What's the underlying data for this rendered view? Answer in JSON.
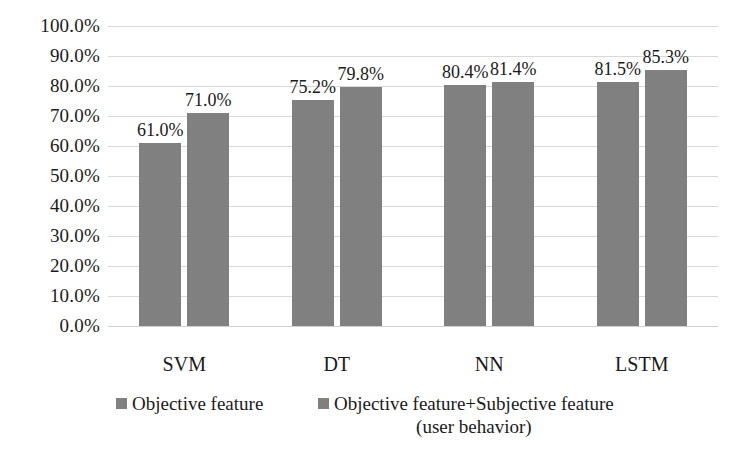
{
  "chart_data": {
    "type": "bar",
    "title": "",
    "xlabel": "",
    "ylabel": "",
    "categories": [
      "SVM",
      "DT",
      "NN",
      "LSTM"
    ],
    "series": [
      {
        "name": "Objective feature",
        "values": [
          61.0,
          75.2,
          80.4,
          81.5
        ],
        "labels": [
          "61.0%",
          "75.2%",
          "80.4%",
          "81.5%"
        ],
        "color": "#808080"
      },
      {
        "name": "Objective feature+Subjective feature (user behavior)",
        "values": [
          71.0,
          79.8,
          81.4,
          85.3
        ],
        "labels": [
          "71.0%",
          "79.8%",
          "81.4%",
          "85.3%"
        ],
        "color": "#808080"
      }
    ],
    "ylim": [
      0,
      100
    ],
    "ytick_values": [
      100,
      90,
      80,
      70,
      60,
      50,
      40,
      30,
      20,
      10,
      0
    ],
    "ytick_labels": [
      "100.0%",
      "90.0%",
      "80.0%",
      "70.0%",
      "60.0%",
      "50.0%",
      "40.0%",
      "30.0%",
      "20.0%",
      "10.0%",
      "0.0%"
    ],
    "grid": true,
    "grid_color": "#d9d9d9",
    "legend_position": "bottom"
  },
  "legend": {
    "entries": [
      {
        "label": "Objective feature"
      },
      {
        "label": "Objective feature+Subjective feature\n(user behavior)"
      }
    ]
  }
}
